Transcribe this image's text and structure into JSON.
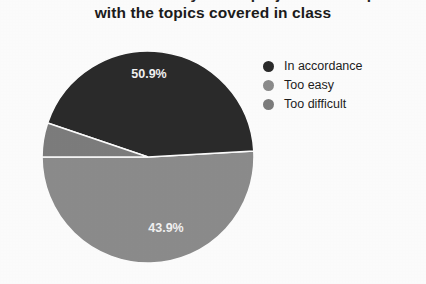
{
  "title": {
    "line1": "Evaluation of the difficulty of the projects in comparison",
    "line2": "with the topics covered in class"
  },
  "legend": {
    "items": [
      {
        "label": "In accordance",
        "color": "#2a2a2a",
        "swatch_icon": "circle-swatch-icon"
      },
      {
        "label": "Too easy",
        "color": "#8c8c8c",
        "swatch_icon": "circle-swatch-icon"
      },
      {
        "label": "Too difficult",
        "color": "#7d7d7d",
        "swatch_icon": "circle-swatch-icon"
      }
    ]
  },
  "chart_data": {
    "type": "pie",
    "title": "Evaluation of the difficulty of the projects in comparison with the topics covered in class",
    "categories": [
      "In accordance",
      "Too easy",
      "Too difficult"
    ],
    "values": [
      43.9,
      50.9,
      5.2
    ],
    "value_unit": "%",
    "data_labels": [
      "43.9%",
      "50.9%",
      "5.2%"
    ],
    "visible_data_labels": [
      "50.9%",
      "43.9%"
    ],
    "colors": [
      "#2a2a2a",
      "#8c8c8c",
      "#7d7d7d"
    ],
    "legend_position": "right",
    "grid": false,
    "xlabel": "",
    "ylabel": "",
    "start_angle_deg": 0,
    "direction": "clockwise",
    "slices": [
      {
        "name": "Too easy",
        "value": 50.9,
        "label": "50.9%",
        "color": "#8c8c8c",
        "label_x": 108,
        "label_y": 28
      },
      {
        "name": "In accordance",
        "value": 43.9,
        "label": "43.9%",
        "color": "#2a2a2a",
        "label_x": 125,
        "label_y": 182
      },
      {
        "name": "Too difficult",
        "value": 5.2,
        "label": "5.2%",
        "color": "#7d7d7d",
        "label_x": 22,
        "label_y": 130
      }
    ]
  }
}
